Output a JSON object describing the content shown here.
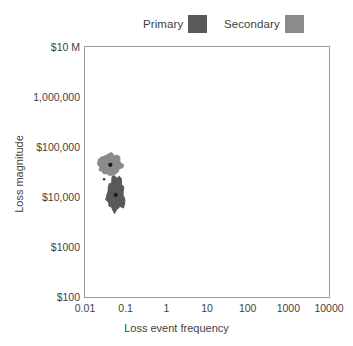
{
  "chart_data": {
    "type": "scatter",
    "title": "",
    "xlabel": "Loss event frequency",
    "ylabel": "Loss magnitude",
    "xscale": "log",
    "yscale": "log",
    "xlim": [
      0.01,
      10000
    ],
    "ylim": [
      100,
      10000000
    ],
    "grid": false,
    "legend_position": "top",
    "xticks": [
      {
        "label": "0.01",
        "value": 0.01
      },
      {
        "label": "0.1",
        "value": 0.1
      },
      {
        "label": "1",
        "value": 1
      },
      {
        "label": "10",
        "value": 10
      },
      {
        "label": "100",
        "value": 100
      },
      {
        "label": "1000",
        "value": 1000
      },
      {
        "label": "10000",
        "value": 10000
      }
    ],
    "yticks": [
      {
        "label": "$10 M",
        "value": 10000000
      },
      {
        "label": "1,000,000",
        "value": 1000000
      },
      {
        "label": "$100,000",
        "value": 100000
      },
      {
        "label": "$10,000",
        "value": 10000
      },
      {
        "label": "$1000",
        "value": 1000
      },
      {
        "label": "$100",
        "value": 100
      }
    ],
    "series": [
      {
        "name": "Primary",
        "color": "#595959",
        "center": {
          "x": 0.057,
          "y": 11000
        },
        "x_range": [
          0.035,
          0.1
        ],
        "y_range": [
          5000,
          26000
        ],
        "point_count": 1,
        "note": "dense dark cloud centred near 0.06 events/yr at about $11,000 per event"
      },
      {
        "name": "Secondary",
        "color": "#8b8b8b",
        "center": {
          "x": 0.042,
          "y": 44000
        },
        "x_range": [
          0.024,
          0.095
        ],
        "y_range": [
          26000,
          72000
        ],
        "point_count": 1,
        "note": "lighter, flatter cloud centred near 0.04 events/yr at about $44,000 per event"
      }
    ]
  },
  "legend": {
    "entries": [
      {
        "label": "Primary",
        "color": "#595959"
      },
      {
        "label": "Secondary",
        "color": "#8b8b8b"
      }
    ]
  },
  "axes": {
    "x_title": "Loss event frequency",
    "y_title": "Loss magnitude"
  }
}
